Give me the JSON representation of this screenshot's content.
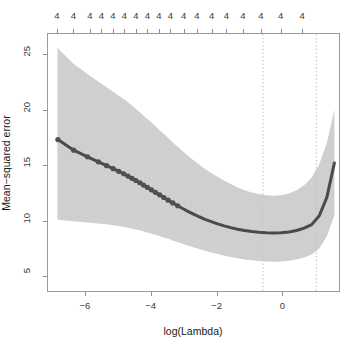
{
  "chart_data": {
    "type": "line",
    "title": "",
    "subtitle": "",
    "xlabel": "log(Lambda)",
    "ylabel": "Mean−squared error",
    "xlim": [
      -7.15,
      1.75
    ],
    "ylim": [
      3.6,
      26.9
    ],
    "grid": false,
    "legend": null,
    "xticks": [
      -6,
      -4,
      -2,
      0
    ],
    "xticklabels": [
      "−6",
      "−4",
      "−2",
      "0"
    ],
    "yticks": [
      5,
      10,
      15,
      20,
      25
    ],
    "yticklabels": [
      "5",
      "10",
      "15",
      "20",
      "25"
    ],
    "top_axis": {
      "label": "",
      "ticks": [
        -6.85,
        -6.35,
        -5.85,
        -5.5,
        -5.15,
        -4.8,
        -4.45,
        -4.1,
        -3.75,
        -3.4,
        -3.0,
        -2.6,
        -2.15,
        -1.7,
        -1.2,
        -0.65,
        -0.05,
        0.6
      ],
      "ticklabels": [
        "4",
        "4",
        "4",
        "4",
        "4",
        "4",
        "4",
        "4",
        "4",
        "4",
        "4",
        "4",
        "4",
        "4",
        "4",
        "4",
        "4",
        "4"
      ]
    },
    "vlines": [
      {
        "x": -0.62,
        "style": "dotted",
        "color": "#bdbdbd"
      },
      {
        "x": 1.0,
        "style": "dotted",
        "color": "#bdbdbd"
      }
    ],
    "series": [
      {
        "name": "Mean-squared error (CV)",
        "color": "#555555",
        "marker": "circle",
        "x": [
          -6.85,
          -6.37,
          -5.95,
          -5.62,
          -5.37,
          -5.17,
          -5.0,
          -4.85,
          -4.72,
          -4.6,
          -4.48,
          -4.36,
          -4.25,
          -4.13,
          -4.01,
          -3.89,
          -3.76,
          -3.63,
          -3.5,
          -3.36,
          -3.21,
          -3.06,
          -2.9,
          -2.73,
          -2.56,
          -2.38,
          -2.19,
          -2.0,
          -1.8,
          -1.6,
          -1.39,
          -1.18,
          -0.96,
          -0.74,
          -0.52,
          -0.29,
          -0.06,
          0.17,
          0.4,
          0.63,
          0.86,
          1.09,
          1.32,
          1.55
        ],
        "y": [
          17.4,
          16.45,
          15.85,
          15.4,
          15.05,
          14.78,
          14.55,
          14.33,
          14.12,
          13.92,
          13.72,
          13.52,
          13.31,
          13.1,
          12.88,
          12.66,
          12.43,
          12.19,
          11.95,
          11.7,
          11.45,
          11.2,
          10.95,
          10.7,
          10.46,
          10.23,
          10.02,
          9.82,
          9.64,
          9.48,
          9.34,
          9.22,
          9.13,
          9.06,
          9.02,
          9.0,
          9.02,
          9.09,
          9.22,
          9.43,
          9.75,
          10.55,
          12.2,
          15.3
        ]
      }
    ],
    "error_band": {
      "name": "CV standard-error band",
      "color": "#c4c4c4",
      "upper": [
        25.6,
        24.2,
        23.3,
        22.6,
        22.1,
        21.7,
        21.35,
        21.05,
        20.75,
        20.45,
        20.15,
        19.85,
        19.55,
        19.25,
        18.95,
        18.6,
        18.25,
        17.9,
        17.55,
        17.15,
        16.75,
        16.35,
        15.95,
        15.55,
        15.15,
        14.75,
        14.4,
        14.05,
        13.7,
        13.4,
        13.1,
        12.85,
        12.65,
        12.5,
        12.4,
        12.35,
        12.4,
        12.55,
        12.85,
        13.3,
        14.0,
        15.2,
        17.1,
        20.1
      ],
      "lower": [
        10.2,
        10.05,
        9.95,
        9.85,
        9.78,
        9.7,
        9.62,
        9.55,
        9.47,
        9.4,
        9.32,
        9.24,
        9.15,
        9.05,
        8.95,
        8.85,
        8.72,
        8.6,
        8.47,
        8.33,
        8.18,
        8.03,
        7.88,
        7.72,
        7.56,
        7.4,
        7.25,
        7.1,
        6.96,
        6.84,
        6.72,
        6.62,
        6.54,
        6.48,
        6.44,
        6.42,
        6.44,
        6.5,
        6.62,
        6.8,
        7.06,
        7.6,
        8.7,
        10.6
      ]
    },
    "errorbar_style": {
      "color": "#d2d2d2",
      "width": 1
    },
    "point_style": {
      "color": "#4f4f4f",
      "radius": 2.6,
      "count_as_points": 20
    },
    "line_style": {
      "color": "#4a4a4a",
      "width": 3
    }
  },
  "axes": {
    "frame_color": "#9a9a9a",
    "background": "#ffffff"
  }
}
